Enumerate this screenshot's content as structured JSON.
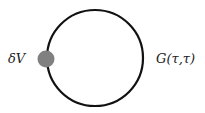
{
  "diagram": {
    "type": "feynman-tadpole",
    "loop": {
      "label": "G(τ,τ)",
      "stroke_color": "#111111",
      "center": [
        95,
        58
      ],
      "radius": 48,
      "stroke_width": 2.2
    },
    "vertex": {
      "label": "δV",
      "fill_color": "#808080",
      "center": [
        46,
        59
      ],
      "radius": 8.5
    }
  }
}
